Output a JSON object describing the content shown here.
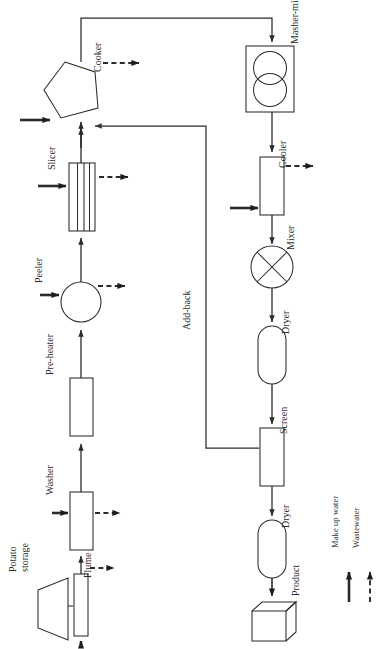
{
  "diagram": {
    "orientation": "rotated-90-ccw",
    "stroke_color": "#2b2b2b",
    "background_color": "#ffffff",
    "nodes": [
      {
        "id": "potato-storage",
        "label": "Potato\nstorage",
        "label_line1": "Potato",
        "label_line2": "storage",
        "shape": "trapezoid-hopper",
        "x": 48,
        "y": 612
      },
      {
        "id": "flume",
        "label": "Flume",
        "shape": "narrow-rectangle",
        "x": 96,
        "y": 612
      },
      {
        "id": "washer",
        "label": "Washer",
        "shape": "rectangle",
        "x": 96,
        "y": 528
      },
      {
        "id": "pre-heater",
        "label": "Pre-heater",
        "shape": "rectangle",
        "x": 96,
        "y": 410
      },
      {
        "id": "peeler",
        "label": "Peeler",
        "shape": "circle",
        "x": 96,
        "y": 300
      },
      {
        "id": "slicer",
        "label": "Slicer",
        "shape": "rectangle-slotted",
        "x": 96,
        "y": 195
      },
      {
        "id": "cooker",
        "label": "Cooker",
        "shape": "pentagon",
        "x": 96,
        "y": 90
      },
      {
        "id": "masher-mixer",
        "label": "Masher-mixer",
        "shape": "rectangle-two-circles",
        "x": 272,
        "y": 85
      },
      {
        "id": "cooler",
        "label": "Cooler",
        "shape": "rectangle",
        "x": 272,
        "y": 188
      },
      {
        "id": "mixer",
        "label": "Mixer",
        "shape": "circle-x",
        "x": 272,
        "y": 265
      },
      {
        "id": "dryer-1",
        "label": "Dryer",
        "shape": "stadium",
        "x": 272,
        "y": 348
      },
      {
        "id": "screen",
        "label": "Screen",
        "shape": "rectangle",
        "x": 272,
        "y": 450
      },
      {
        "id": "dryer-2",
        "label": "Dryer",
        "shape": "stadium",
        "x": 272,
        "y": 528
      },
      {
        "id": "product",
        "label": "Product",
        "shape": "cube-3d",
        "x": 272,
        "y": 610
      }
    ],
    "stream_labels": [
      {
        "id": "add-back",
        "label": "Add-back",
        "x": 196,
        "y": 390
      }
    ]
  },
  "legend": {
    "items": [
      {
        "id": "make-up-water",
        "label": "Make up water",
        "line_style": "solid",
        "arrow": "up"
      },
      {
        "id": "wastewater",
        "label": "Wastewater",
        "line_style": "dashed",
        "arrow": "up"
      }
    ]
  }
}
